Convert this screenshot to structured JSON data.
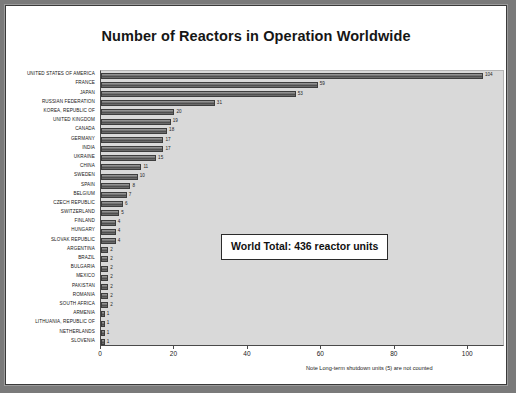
{
  "figure": {
    "note": "Note Long-term shutdown units (5) are not counted",
    "callout": "World Total:  436 reactor units"
  },
  "chart_data": {
    "type": "bar",
    "orientation": "horizontal",
    "title": "Number of Reactors in Operation Worldwide",
    "xlabel": "",
    "ylabel": "",
    "xlim": [
      0,
      110
    ],
    "xticks": [
      0,
      20,
      40,
      60,
      80,
      100
    ],
    "xticklabels": [
      "0",
      "20",
      "40",
      "60",
      "80",
      "100"
    ],
    "grid": false,
    "legend": null,
    "bar_color": "#6a6a6a",
    "plot_background": "#d9d9d9",
    "total": 436,
    "annotation": "World Total:  436 reactor units",
    "footnote": "Note Long-term shutdown units (5) are not counted",
    "categories": [
      "UNITED STATES OF AMERICA",
      "FRANCE",
      "JAPAN",
      "RUSSIAN FEDERATION",
      "KOREA, REPUBLIC OF",
      "UNITED KINGDOM",
      "CANADA",
      "GERMANY",
      "INDIA",
      "UKRAINE",
      "CHINA",
      "SWEDEN",
      "SPAIN",
      "BELGIUM",
      "CZECH REPUBLIC",
      "SWITZERLAND",
      "FINLAND",
      "HUNGARY",
      "SLOVAK REPUBLIC",
      "ARGENTINA",
      "BRAZIL",
      "BULGARIA",
      "MEXICO",
      "PAKISTAN",
      "ROMANIA",
      "SOUTH AFRICA",
      "ARMENIA",
      "LITHUANIA, REPUBLIC OF",
      "NETHERLANDS",
      "SLOVENIA"
    ],
    "values": [
      104,
      59,
      53,
      31,
      20,
      19,
      18,
      17,
      17,
      15,
      11,
      10,
      8,
      7,
      6,
      5,
      4,
      4,
      4,
      2,
      2,
      2,
      2,
      2,
      2,
      2,
      1,
      1,
      1,
      1
    ]
  }
}
